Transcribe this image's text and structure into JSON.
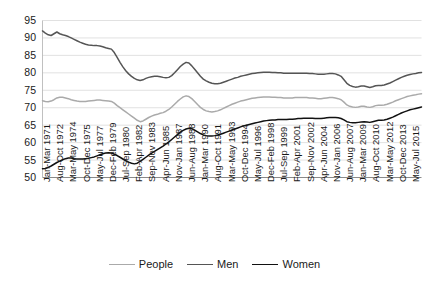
{
  "chart_data": {
    "type": "line",
    "title": "",
    "subtitle": "",
    "xlabel": "",
    "ylabel": "",
    "ylim": [
      50,
      95
    ],
    "ytick_step": 5,
    "yticks": [
      50,
      55,
      60,
      65,
      70,
      75,
      80,
      85,
      90,
      95
    ],
    "grid": true,
    "grid_axis": "y",
    "legend_position": "bottom-center",
    "x_tick_labels": [
      "Jan-Mar 1971",
      "Aug-Oct 1972",
      "Mar-May 1974",
      "Oct-Dec 1975",
      "May-Jul 1977",
      "Dec-Feb 1979",
      "Jul-Sep 1980",
      "Feb-Apr 1982",
      "Sep-Nov 1983",
      "Apr-Jun 1985",
      "Nov-Jan 1987",
      "Jun-Aug 1988",
      "Jan-Mar 1990",
      "Aug-Oct 1991",
      "Mar-May 1993",
      "Oct-Dec 1994",
      "May-Jul 1996",
      "Dec-Feb 1998",
      "Jul-Sep 1999",
      "Feb-Apr 2001",
      "Sep-Nov 2002",
      "Apr-Jun 2004",
      "Nov-Jan 2006",
      "Jun-Aug 2007",
      "Jan-Mar 2009",
      "Aug-Oct 2010",
      "Mar-May 2012",
      "Oct-Dec 2013",
      "May-Jul 2015"
    ],
    "series": [
      {
        "name": "People",
        "color": "#aaaaaa",
        "values": [
          72.0,
          71.8,
          71.7,
          71.9,
          72.3,
          72.8,
          73.0,
          73.0,
          72.8,
          72.6,
          72.3,
          72.1,
          71.9,
          71.8,
          71.8,
          71.8,
          71.9,
          72.0,
          72.1,
          72.2,
          72.2,
          72.1,
          72.0,
          71.9,
          71.8,
          71.3,
          70.6,
          70.0,
          69.4,
          68.8,
          68.2,
          67.6,
          67.0,
          66.4,
          66.0,
          66.2,
          66.7,
          67.2,
          67.6,
          67.9,
          68.1,
          68.4,
          68.6,
          69.0,
          69.5,
          70.2,
          71.0,
          71.8,
          72.5,
          73.1,
          73.4,
          73.2,
          72.6,
          71.8,
          70.9,
          70.1,
          69.5,
          69.1,
          68.9,
          68.8,
          68.9,
          69.1,
          69.4,
          69.8,
          70.2,
          70.6,
          71.0,
          71.3,
          71.6,
          71.9,
          72.1,
          72.3,
          72.5,
          72.7,
          72.8,
          72.9,
          73.0,
          73.1,
          73.1,
          73.1,
          73.0,
          73.0,
          72.9,
          72.9,
          72.8,
          72.8,
          72.8,
          72.8,
          72.9,
          72.9,
          72.9,
          72.9,
          72.9,
          72.8,
          72.8,
          72.7,
          72.6,
          72.6,
          72.7,
          72.8,
          72.9,
          72.9,
          72.8,
          72.6,
          72.3,
          71.6,
          70.8,
          70.4,
          70.2,
          70.1,
          70.2,
          70.4,
          70.4,
          70.2,
          70.1,
          70.3,
          70.6,
          70.7,
          70.7,
          70.8,
          71.0,
          71.3,
          71.6,
          72.0,
          72.3,
          72.6,
          72.9,
          73.2,
          73.4,
          73.6,
          73.7,
          73.9,
          74.0
        ]
      },
      {
        "name": "Men",
        "color": "#555555",
        "values": [
          92.0,
          91.4,
          90.9,
          90.7,
          91.2,
          91.7,
          91.2,
          90.9,
          90.7,
          90.4,
          90.0,
          89.6,
          89.2,
          88.8,
          88.5,
          88.2,
          88.0,
          87.9,
          87.8,
          87.8,
          87.7,
          87.5,
          87.2,
          87.0,
          86.8,
          85.8,
          84.4,
          83.0,
          81.7,
          80.6,
          79.7,
          79.0,
          78.4,
          78.0,
          77.8,
          78.0,
          78.4,
          78.7,
          78.9,
          79.0,
          79.0,
          78.9,
          78.7,
          78.6,
          78.7,
          79.2,
          80.0,
          80.9,
          81.8,
          82.5,
          83.0,
          82.8,
          82.0,
          81.0,
          80.0,
          79.0,
          78.2,
          77.7,
          77.3,
          77.0,
          76.9,
          76.9,
          77.0,
          77.3,
          77.6,
          77.9,
          78.2,
          78.5,
          78.7,
          79.0,
          79.2,
          79.4,
          79.6,
          79.8,
          79.9,
          80.0,
          80.1,
          80.2,
          80.2,
          80.2,
          80.1,
          80.1,
          80.0,
          80.0,
          79.9,
          79.9,
          79.9,
          79.9,
          79.9,
          79.9,
          79.9,
          79.9,
          79.9,
          79.8,
          79.8,
          79.7,
          79.6,
          79.6,
          79.6,
          79.7,
          79.8,
          79.8,
          79.7,
          79.4,
          79.0,
          78.0,
          77.0,
          76.4,
          76.1,
          75.9,
          76.0,
          76.2,
          76.2,
          76.0,
          75.8,
          76.0,
          76.3,
          76.4,
          76.4,
          76.5,
          76.8,
          77.1,
          77.5,
          77.9,
          78.3,
          78.7,
          79.0,
          79.3,
          79.5,
          79.7,
          79.8,
          80.0,
          80.1
        ]
      },
      {
        "name": "Women",
        "color": "#111111",
        "values": [
          52.5,
          52.6,
          52.9,
          53.3,
          53.8,
          54.3,
          54.7,
          55.1,
          55.4,
          55.6,
          55.6,
          55.4,
          55.3,
          55.3,
          55.3,
          55.4,
          55.5,
          55.7,
          55.9,
          56.2,
          56.5,
          56.8,
          57.0,
          57.1,
          57.0,
          56.7,
          56.3,
          55.8,
          55.3,
          54.8,
          54.4,
          54.1,
          53.9,
          54.1,
          54.6,
          55.2,
          55.8,
          56.4,
          57.0,
          57.5,
          58.0,
          58.5,
          59.0,
          59.6,
          60.2,
          60.9,
          61.6,
          62.3,
          63.0,
          63.5,
          63.9,
          64.1,
          64.0,
          63.6,
          63.1,
          62.6,
          62.2,
          62.0,
          61.9,
          61.9,
          62.0,
          62.2,
          62.4,
          62.7,
          63.0,
          63.3,
          63.6,
          63.9,
          64.2,
          64.5,
          64.8,
          65.0,
          65.2,
          65.4,
          65.6,
          65.8,
          66.0,
          66.2,
          66.3,
          66.4,
          66.5,
          66.5,
          66.6,
          66.6,
          66.6,
          66.6,
          66.7,
          66.7,
          66.8,
          66.9,
          66.9,
          67.0,
          67.0,
          67.0,
          67.0,
          66.9,
          66.9,
          66.9,
          67.0,
          67.1,
          67.2,
          67.2,
          67.2,
          67.1,
          66.9,
          66.5,
          66.0,
          65.8,
          65.7,
          65.7,
          65.8,
          65.9,
          66.0,
          65.9,
          65.8,
          66.0,
          66.2,
          66.4,
          66.4,
          66.5,
          66.7,
          67.0,
          67.3,
          67.7,
          68.1,
          68.5,
          68.8,
          69.1,
          69.4,
          69.6,
          69.8,
          70.0,
          70.2
        ]
      }
    ]
  },
  "legend": {
    "items": [
      {
        "label": "People",
        "color": "#aaaaaa"
      },
      {
        "label": "Men",
        "color": "#555555"
      },
      {
        "label": "Women",
        "color": "#111111"
      }
    ]
  }
}
